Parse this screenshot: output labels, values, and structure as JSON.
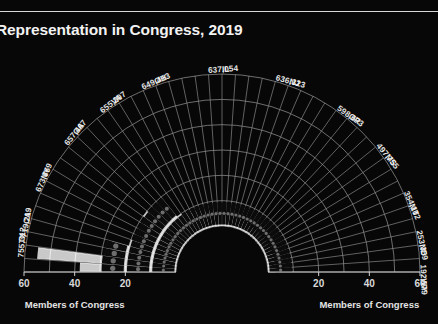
{
  "title": "Representation in Congress, 2019",
  "axes": {
    "left_caption": "Members of Congress",
    "right_caption": "Members of Congress",
    "left_ticks": [
      "60",
      "40",
      "20"
    ],
    "right_ticks": [
      "20",
      "40",
      "60"
    ]
  },
  "chart_data": {
    "type": "bar",
    "title": "Representation in Congress, 2019",
    "xlabel": "Members of Congress",
    "ylabel": "",
    "layout": "polar-semicircle",
    "grid": true,
    "legend": false,
    "xlim": [
      0,
      60
    ],
    "annotated_states": [
      {
        "code": "TX",
        "value": "755,312",
        "members": 38
      },
      {
        "code": "CA",
        "value": "719,219",
        "members": 55
      },
      {
        "code": "NY",
        "value": "673,869",
        "members": 29
      },
      {
        "code": "GA",
        "value": "657,467",
        "members": 16
      },
      {
        "code": "VA",
        "value": "655,207",
        "members": 13
      },
      {
        "code": "OH",
        "value": "649,413",
        "members": 18
      },
      {
        "code": "IL",
        "value": "637,054",
        "members": 20
      },
      {
        "code": "NJ",
        "value": "636,323",
        "members": 14
      },
      {
        "code": "OR",
        "value": "598,673",
        "members": 7
      },
      {
        "code": "MS",
        "value": "497,755",
        "members": 6
      },
      {
        "code": "MT",
        "value": "354,102",
        "members": 3
      },
      {
        "code": "ND",
        "value": "253,359",
        "members": 3
      },
      {
        "code": "WY",
        "value": "192,579",
        "members": 3
      }
    ],
    "categories": [
      "TX",
      "CA",
      "NY",
      "GA",
      "VA",
      "OH",
      "IL",
      "NJ",
      "OR",
      "MS",
      "MT",
      "ND",
      "WY"
    ],
    "values": [
      38,
      55,
      29,
      16,
      13,
      18,
      20,
      14,
      7,
      6,
      3,
      3,
      3
    ],
    "wedge_values": [
      38,
      55,
      29,
      27,
      20,
      16,
      14,
      13,
      18,
      20,
      14,
      12,
      11,
      10,
      9,
      9,
      8,
      8,
      7,
      7,
      6,
      6,
      6,
      5,
      5,
      5,
      4,
      4,
      4,
      4,
      3,
      3,
      3,
      3,
      3,
      3,
      3,
      3,
      3,
      3,
      3,
      3,
      3,
      3,
      3,
      3
    ]
  },
  "colors": {
    "background": "#070707",
    "bar": "#c9c9c9",
    "grid": "#8c8c8c",
    "dot": "#6e6e6e",
    "text": "#ededed"
  }
}
